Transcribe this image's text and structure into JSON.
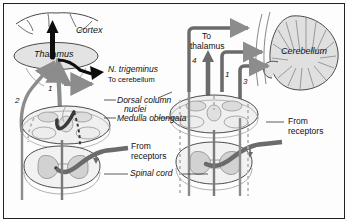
{
  "figure": {
    "border_color": "#222222",
    "background": "#fdfdfd"
  },
  "palette": {
    "gray_tract": "#8c8c8c",
    "dark_tract": "#3a3a3a",
    "black_arrow": "#0d0d0d",
    "structure_fill": "#e3e3e3",
    "structure_fill_light": "#f0f0f0",
    "gray_matter_fill": "#cfcfcf",
    "outline": "#4a4a4a",
    "text": "#111111"
  },
  "labels": {
    "cortex": "Cortex",
    "thalamus": "Thalamus",
    "n_trigeminus": "N. trigeminus",
    "to_cerebellum": "To cerebellum",
    "dorsal_column_nuclei_line1": "Dorsal column",
    "dorsal_column_nuclei_line2": "nuclei",
    "medulla_oblongata": "Medulla oblongata",
    "from_receptors_left_line1": "From",
    "from_receptors_left_line2": "receptors",
    "spinal_cord": "Spinal cord",
    "to_thalamus_line1": "To",
    "to_thalamus_line2": "thalamus",
    "cerebellum": "Cerebellum",
    "from_receptors_right_line1": "From",
    "from_receptors_right_line2": "receptors"
  },
  "numbers": {
    "left_one": "1",
    "left_two": "2",
    "right_four": "4",
    "right_one": "1",
    "right_three": "3"
  },
  "panels": [
    {
      "name": "left-panel",
      "description": "Dorsal column–medial lemniscus pathway: receptors → spinal cord → dorsal column nuclei → thalamus → cortex",
      "structures": [
        "Cortex",
        "Thalamus",
        "Dorsal column nuclei",
        "Medulla oblongata",
        "Spinal cord"
      ],
      "pathway_numbers": [
        "1",
        "2"
      ]
    },
    {
      "name": "right-panel",
      "description": "Spinocerebellar pathways: receptors → spinal cord → medulla → cerebellum, plus collateral to thalamus",
      "structures": [
        "Cerebellum",
        "Medulla oblongata",
        "Spinal cord"
      ],
      "pathway_numbers": [
        "4",
        "1",
        "3"
      ]
    }
  ]
}
